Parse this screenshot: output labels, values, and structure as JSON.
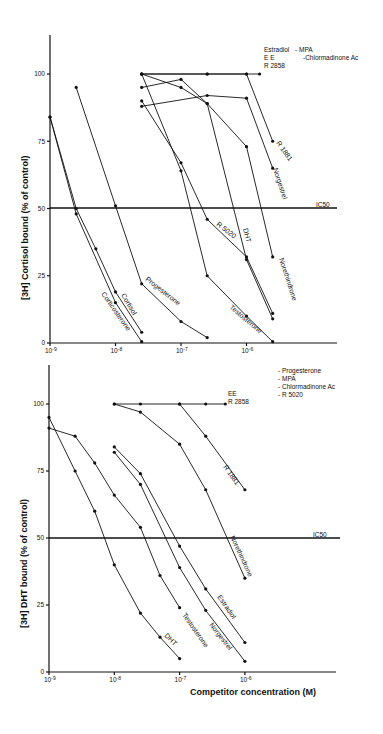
{
  "chart_data": [
    {
      "type": "line",
      "title": "",
      "xlabel": "",
      "ylabel": "[3H] Cortisol bound (% of control)",
      "xscale": "log",
      "x_ticks": [
        "10-9",
        "10-8",
        "10-7",
        "10-6"
      ],
      "y_ticks": [
        "0",
        "25",
        "50",
        "75",
        "100"
      ],
      "ylim": [
        0,
        115
      ],
      "reference_line": {
        "label": "IC50",
        "y": 50
      },
      "legend_note": {
        "left": [
          "Estradiol",
          "EE",
          "R 2858"
        ],
        "right": [
          "- MPA",
          "-Chlormadinone Ac"
        ]
      },
      "series": [
        {
          "name": "Corticosterone",
          "log_x": [
            -9,
            -8.6,
            -8.0,
            -7.6
          ],
          "values": [
            84,
            48,
            15,
            0.5
          ]
        },
        {
          "name": "Cortisol",
          "log_x": [
            -9,
            -8.6,
            -8.3,
            -8.0,
            -7.6
          ],
          "values": [
            84,
            50,
            35,
            19,
            4
          ]
        },
        {
          "name": "Progesterone",
          "log_x": [
            -8.6,
            -8.0,
            -7.6,
            -7.0,
            -6.6
          ],
          "values": [
            95,
            51,
            22,
            8,
            2
          ]
        },
        {
          "name": "Testosterone",
          "log_x": [
            -7.6,
            -7.0,
            -6.6,
            -6.0,
            -5.6
          ],
          "values": [
            100,
            64,
            25,
            10,
            0.5
          ]
        },
        {
          "name": "R 5020",
          "log_x": [
            -7.6,
            -7.0,
            -6.6,
            -6.0,
            -5.6
          ],
          "values": [
            90,
            67,
            46,
            32,
            11
          ]
        },
        {
          "name": "DHT",
          "log_x": [
            -7.6,
            -7.0,
            -6.6,
            -6.0,
            -5.6
          ],
          "values": [
            95,
            98,
            89,
            31,
            9
          ]
        },
        {
          "name": "Norethindrone",
          "log_x": [
            -7.6,
            -7.0,
            -6.6,
            -6.0,
            -5.6
          ],
          "values": [
            100,
            95,
            89,
            73,
            32
          ]
        },
        {
          "name": "Norgestrel",
          "log_x": [
            -7.6,
            -6.6,
            -6.0,
            -5.6
          ],
          "values": [
            88,
            92,
            91,
            65
          ]
        },
        {
          "name": "R 1881",
          "log_x": [
            -7.6,
            -6.6,
            -6.0,
            -5.6
          ],
          "values": [
            100,
            100,
            100,
            75
          ]
        },
        {
          "name": "Estradiol / EE / R 2858 / MPA / Chlormadinone Ac",
          "log_x": [
            -7.6,
            -6.6,
            -6.0,
            -5.8
          ],
          "values": [
            100,
            100,
            100,
            100
          ]
        }
      ]
    },
    {
      "type": "line",
      "title": "",
      "xlabel": "Competitor concentration (M)",
      "ylabel": "[3H] DHT bound (% of control)",
      "xscale": "log",
      "x_ticks": [
        "10-9",
        "10-8",
        "10-7",
        "10-6"
      ],
      "y_ticks": [
        "0",
        "25",
        "50",
        "75",
        "100"
      ],
      "ylim": [
        0,
        115
      ],
      "reference_line": {
        "label": "IC50",
        "y": 50
      },
      "legend_note": {
        "left": [
          "EE",
          "R 2858"
        ],
        "right": [
          "- Progesterone",
          "- MPA",
          "- Chlormadinone Ac",
          "- R 5020"
        ]
      },
      "series": [
        {
          "name": "DHT",
          "log_x": [
            -9,
            -8.6,
            -8.3,
            -8.0,
            -7.6,
            -7.3,
            -7.0
          ],
          "values": [
            95,
            75,
            60,
            40,
            22,
            13,
            5
          ]
        },
        {
          "name": "Testosterone",
          "log_x": [
            -9,
            -8.6,
            -8.3,
            -8.0,
            -7.6,
            -7.3,
            -7.0
          ],
          "values": [
            91,
            88,
            78,
            66,
            54,
            36,
            24
          ]
        },
        {
          "name": "Norgestrel",
          "log_x": [
            -8.0,
            -7.6,
            -7.0,
            -6.6,
            -6.0
          ],
          "values": [
            82,
            70,
            39,
            23,
            4
          ]
        },
        {
          "name": "Estradiol",
          "log_x": [
            -8.0,
            -7.6,
            -7.0,
            -6.6,
            -6.0
          ],
          "values": [
            84,
            74,
            47,
            31,
            11
          ]
        },
        {
          "name": "Norethindrone",
          "log_x": [
            -8.0,
            -7.6,
            -7.0,
            -6.6,
            -6.0
          ],
          "values": [
            100,
            97,
            85,
            68,
            35
          ]
        },
        {
          "name": "R 1881",
          "log_x": [
            -7.0,
            -6.6,
            -6.0
          ],
          "values": [
            100,
            88,
            68
          ]
        },
        {
          "name": "EE / R 2858 / Progesterone / MPA / Chlormadinone Ac / R 5020",
          "log_x": [
            -8.0,
            -7.6,
            -7.0,
            -6.6,
            -6.3
          ],
          "values": [
            100,
            100,
            100,
            100,
            100
          ]
        }
      ]
    }
  ],
  "labels": {
    "top": {
      "ylabel_prefix": "[3H]",
      "ylabel_rest": " Cortisol bound (% of control)",
      "ic50": "IC50",
      "legend_l1": "Estradiol",
      "legend_l1r": "- MPA",
      "legend_l2": "E E",
      "legend_l2r": "-Chlormadinone Ac",
      "legend_l3": "R 2858",
      "corticosterone": "Corticosterone",
      "cortisol": "Cortisol",
      "progesterone": "Progesterone",
      "testosterone": "Testosterone",
      "r5020": "R 5020",
      "dht": "DHT",
      "norethindrone": "Norethindrone",
      "norgestrel": "Norgestrel",
      "r1881": "R 1881"
    },
    "bottom": {
      "ylabel_prefix": "[3H]",
      "ylabel_rest": " DHT bound  (% of control)",
      "xlabel": "Competitor concentration (M)",
      "ic50": "IC50",
      "ee": "EE",
      "r2858": "R 2858",
      "legend_1": "- Progesterone",
      "legend_2": "- MPA",
      "legend_3": "- Chlormadinone Ac",
      "legend_4": "- R  5020",
      "dht": "DHT",
      "testosterone": "Testosterone",
      "norgestrel": "Norgestrel",
      "estradiol": "Estradiol",
      "norethindrone": "Norethindrone",
      "r1881": "R 1881"
    },
    "ticks": {
      "y0": "0",
      "y25": "25",
      "y50": "50",
      "y75": "75",
      "y100": "100",
      "x9": "10-9",
      "x8": "10-8",
      "x7": "10-7",
      "x6": "10-6"
    }
  }
}
